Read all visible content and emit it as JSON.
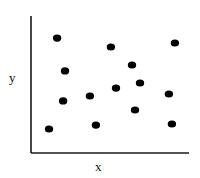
{
  "chart_data": {
    "type": "scatter",
    "title": "",
    "xlabel": "x",
    "ylabel": "y",
    "xlim": [
      0,
      10
    ],
    "ylim": [
      0,
      10
    ],
    "grid": false,
    "legend": null,
    "ticks": "none",
    "series": [
      {
        "name": "points",
        "color": "#000000",
        "points": [
          {
            "x": 1.65,
            "y": 8.39
          },
          {
            "x": 5.06,
            "y": 7.74
          },
          {
            "x": 9.11,
            "y": 8.03
          },
          {
            "x": 2.15,
            "y": 5.99
          },
          {
            "x": 6.39,
            "y": 6.42
          },
          {
            "x": 6.9,
            "y": 5.11
          },
          {
            "x": 5.38,
            "y": 4.74
          },
          {
            "x": 3.73,
            "y": 4.16
          },
          {
            "x": 2.03,
            "y": 3.8
          },
          {
            "x": 8.73,
            "y": 4.31
          },
          {
            "x": 6.58,
            "y": 3.14
          },
          {
            "x": 1.14,
            "y": 1.75
          },
          {
            "x": 4.11,
            "y": 2.04
          },
          {
            "x": 8.92,
            "y": 2.12
          }
        ]
      }
    ]
  },
  "layout": {
    "plot_left": 31,
    "plot_right": 189,
    "plot_top": 16,
    "plot_bottom": 153,
    "marker_rx": 4.2,
    "marker_ry": 3.6,
    "axis_color": "#1a1a1a",
    "axis_width": 1.6
  }
}
